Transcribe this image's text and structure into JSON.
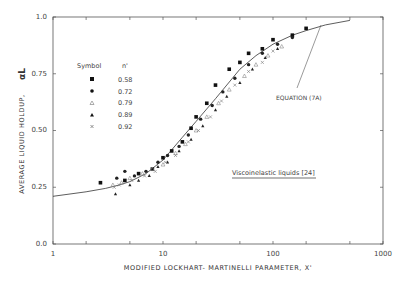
{
  "chart_data": {
    "type": "scatter",
    "title": "",
    "xlabel": "MODIFIED  LOCKHART- MARTINELLI  PARAMETER, X'",
    "ylabel": "AVERAGE  LIQUID  HOLDUP, αL",
    "xscale": "log",
    "xlim": [
      1,
      1000
    ],
    "ylim": [
      0.0,
      1.0
    ],
    "x_ticks": [
      "1",
      "10",
      "100",
      "1000"
    ],
    "y_ticks": [
      "0.0",
      "0.25",
      "0.50",
      "0.75",
      "1.0"
    ],
    "grid": false,
    "legend": {
      "position": "upper-left",
      "header_symbol": "Symbol",
      "header_n": "n'",
      "entries": [
        {
          "symbol": "filled-square",
          "n": "0.58"
        },
        {
          "symbol": "filled-circle",
          "n": "0.72"
        },
        {
          "symbol": "open-triangle",
          "n": "0.79"
        },
        {
          "symbol": "filled-triangle",
          "n": "0.89"
        },
        {
          "symbol": "cross",
          "n": "0.92"
        }
      ]
    },
    "annotations": [
      {
        "text": "EQUATION (7A)",
        "points_to": [
          300,
          0.97
        ]
      },
      {
        "text": "Viscoinelastic liquids [24]",
        "underlined": true
      }
    ],
    "curve": {
      "name": "Equation (7A)",
      "x": [
        1,
        2,
        3,
        4,
        5,
        7,
        10,
        15,
        20,
        30,
        50,
        70,
        100,
        150,
        200,
        300,
        500
      ],
      "y": [
        0.21,
        0.23,
        0.245,
        0.26,
        0.275,
        0.31,
        0.37,
        0.47,
        0.54,
        0.64,
        0.77,
        0.83,
        0.88,
        0.92,
        0.94,
        0.965,
        0.985
      ]
    },
    "series": [
      {
        "name": "n' = 0.58",
        "marker": "filled-square",
        "x": [
          2.7,
          4.5,
          6,
          8,
          10,
          12,
          15,
          18,
          20,
          25,
          30,
          40,
          50,
          60,
          80,
          100,
          150,
          200
        ],
        "y": [
          0.27,
          0.28,
          0.31,
          0.33,
          0.38,
          0.41,
          0.45,
          0.51,
          0.56,
          0.62,
          0.7,
          0.77,
          0.8,
          0.84,
          0.86,
          0.9,
          0.92,
          0.95
        ]
      },
      {
        "name": "n' = 0.72",
        "marker": "filled-circle",
        "x": [
          3.8,
          4.5,
          5.5,
          7,
          9,
          11,
          14,
          17,
          22,
          28,
          35,
          45,
          60,
          80,
          110,
          150
        ],
        "y": [
          0.29,
          0.32,
          0.3,
          0.32,
          0.36,
          0.39,
          0.43,
          0.48,
          0.55,
          0.61,
          0.67,
          0.73,
          0.79,
          0.84,
          0.88,
          0.91
        ]
      },
      {
        "name": "n' = 0.79",
        "marker": "open-triangle",
        "x": [
          3.5,
          4.2,
          5,
          6.5,
          8,
          10,
          13,
          16,
          20,
          25,
          32,
          40,
          55,
          70,
          90,
          120
        ],
        "y": [
          0.26,
          0.27,
          0.29,
          0.31,
          0.33,
          0.35,
          0.4,
          0.44,
          0.5,
          0.56,
          0.62,
          0.68,
          0.74,
          0.79,
          0.83,
          0.87
        ]
      },
      {
        "name": "n' = 0.89",
        "marker": "filled-triangle",
        "x": [
          3.7,
          5,
          6,
          7.5,
          9,
          11,
          14,
          18,
          23,
          30,
          38,
          50,
          65,
          85,
          110
        ],
        "y": [
          0.22,
          0.26,
          0.28,
          0.3,
          0.34,
          0.36,
          0.41,
          0.46,
          0.52,
          0.59,
          0.65,
          0.71,
          0.77,
          0.82,
          0.86
        ]
      },
      {
        "name": "n' = 0.92",
        "marker": "cross",
        "x": [
          3.6,
          4,
          5.2,
          6.8,
          8.5,
          10.5,
          13,
          17,
          21,
          27,
          34,
          45,
          60,
          80,
          100
        ],
        "y": [
          0.25,
          0.26,
          0.28,
          0.3,
          0.32,
          0.36,
          0.39,
          0.45,
          0.5,
          0.56,
          0.63,
          0.7,
          0.76,
          0.8,
          0.85
        ]
      }
    ]
  },
  "text": {
    "xlabel": "MODIFIED   LOCKHART- MARTINELLI   PARAMETER, X'",
    "ylabel": "AVERAGE   LIQUID   HOLDUP,",
    "ylabel_symbol": "αL",
    "legend_symbol_header": "Symbol",
    "legend_n_header": "n'",
    "legend_values": [
      "0.58",
      "0.72",
      "0.79",
      "0.89",
      "0.92"
    ],
    "eq_label": "EQUATION (7A)",
    "visco_label": "Viscoinelastic liquids [24]",
    "xticks": [
      "1",
      "10",
      "100",
      "1000"
    ],
    "yticks": [
      "0.0",
      "0.25",
      "0.50",
      "0.75",
      "1.0"
    ]
  }
}
